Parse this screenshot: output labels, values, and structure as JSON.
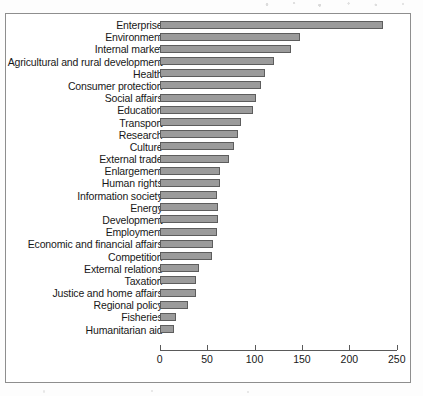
{
  "figure": {
    "background_color": "#ffffff",
    "frame_color": "#8e8e8e",
    "bar_fill_color": "#9b9b9b",
    "bar_edge_color": "#5d5d5d",
    "axis_color": "#5a5a5a"
  },
  "chart_data": {
    "type": "bar",
    "orientation": "horizontal",
    "title": "",
    "subtitle": "",
    "xlabel": "",
    "ylabel": "",
    "xlim": [
      0,
      250
    ],
    "xticks": [
      0,
      50,
      100,
      150,
      200,
      250
    ],
    "xtick_labels": [
      "0",
      "50",
      "100",
      "150",
      "200",
      "250"
    ],
    "grid": false,
    "legend": null,
    "sorted": "descending",
    "categories": [
      "Enterprise",
      "Environment",
      "Internal market",
      "Agricultural and rural development",
      "Health",
      "Consumer protection",
      "Social affairs",
      "Education",
      "Transport",
      "Research",
      "Culture",
      "External trade",
      "Enlargement",
      "Human rights",
      "Information society",
      "Energy",
      "Development",
      "Employment",
      "Economic and financial affairs",
      "Competition",
      "External relations",
      "Taxation",
      "Justice and home affairs",
      "Regional policy",
      "Fisheries",
      "Humanitarian aid"
    ],
    "values": [
      235,
      148,
      138,
      121,
      111,
      107,
      102,
      98,
      86,
      83,
      78,
      73,
      64,
      64,
      60,
      61,
      62,
      60,
      56,
      55,
      41,
      38,
      38,
      30,
      17,
      15
    ]
  }
}
